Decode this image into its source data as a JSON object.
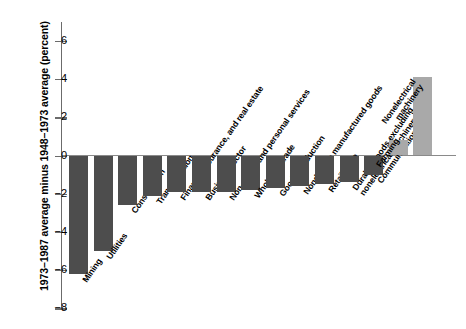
{
  "chart_data": {
    "type": "bar",
    "title": "",
    "xlabel": "",
    "ylabel": "1973–1987 average minus 1948–1973 average (percent)",
    "ylim": [
      -8,
      7
    ],
    "yticks": [
      6,
      4,
      2,
      0,
      -2,
      -4,
      -6,
      -8
    ],
    "ytick_labels": [
      "6",
      "4",
      "2",
      "0",
      "−2",
      "−4",
      "−6",
      "−8"
    ],
    "grid": false,
    "legend": "none",
    "categories": [
      "Mining",
      "Utilities",
      "Construction",
      "Transportation",
      "Finance, insurance, and real estate",
      "Business sector",
      "Non-goods and personal services",
      "Wholesale trade",
      "Goods production",
      "Nondurable manufactured goods",
      "Retail trade",
      "Durable goods excluding nonelectrical machinery",
      "Communications",
      "Farming",
      "Nonelectrical machinery"
    ],
    "values": [
      -6.2,
      -5.0,
      -2.6,
      -2.1,
      -1.9,
      -1.9,
      -1.9,
      -1.8,
      -1.7,
      -1.6,
      -1.5,
      -1.4,
      -1.0,
      0.8,
      4.1
    ],
    "bar_colors": {
      "negative": "#4d4d4d",
      "positive": "#a9a9a9"
    }
  },
  "axis": {
    "zero_value": "0"
  }
}
